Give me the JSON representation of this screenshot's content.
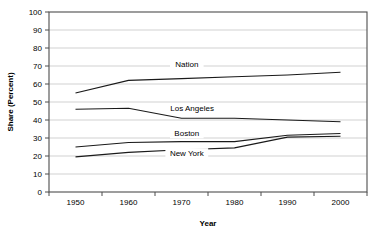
{
  "chart_data": {
    "type": "line",
    "title": "",
    "xlabel": "Year",
    "ylabel": "Share (Percent)",
    "xlim": [
      1945,
      2005
    ],
    "ylim": [
      0,
      100
    ],
    "grid": true,
    "legend_position": "inline-labels",
    "x": [
      1950,
      1960,
      1970,
      1980,
      1990,
      2000
    ],
    "xticklabels": [
      "1950",
      "1960",
      "1970",
      "1980",
      "1990",
      "2000"
    ],
    "yticklabels": [
      "0",
      "10",
      "20",
      "30",
      "40",
      "50",
      "60",
      "70",
      "80",
      "90",
      "100"
    ],
    "yticks": [
      0,
      10,
      20,
      30,
      40,
      50,
      60,
      70,
      80,
      90,
      100
    ],
    "series": [
      {
        "name": "Nation",
        "values": [
          55,
          62,
          63,
          64,
          65,
          66.5
        ],
        "label": "Nation",
        "label_x": 1971,
        "label_y": 70
      },
      {
        "name": "Los Angeles",
        "values": [
          46,
          46.5,
          41,
          41,
          40,
          39
        ],
        "label": "Los Angeles",
        "label_x": 1972,
        "label_y": 45.5
      },
      {
        "name": "Boston",
        "values": [
          25,
          27.5,
          28,
          28,
          31.5,
          32.5
        ],
        "label": "Boston",
        "label_x": 1971,
        "label_y": 31.5
      },
      {
        "name": "New York",
        "values": [
          19.5,
          22,
          23.5,
          24.5,
          30.5,
          31
        ],
        "label": "New York",
        "label_x": 1971,
        "label_y": 20.5
      }
    ]
  },
  "axes": {
    "y_axis_title": "Share (Percent)",
    "x_axis_title": "Year"
  }
}
